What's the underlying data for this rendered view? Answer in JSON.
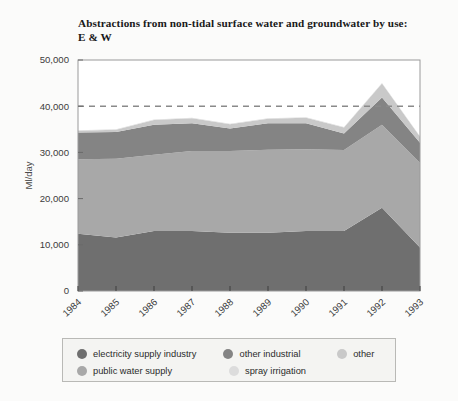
{
  "figure": {
    "background_color": "#fbfbfa",
    "title_line1": "Abstractions from non-tidal surface water and groundwater by use:",
    "title_line2": "E & W"
  },
  "axes": {
    "y_axis_label": "Ml/day",
    "y_ticks": [
      "0",
      "10,000",
      "20,000",
      "30,000",
      "40,000",
      "50,000"
    ],
    "x_ticks": [
      "1984",
      "1985",
      "1986",
      "1987",
      "1988",
      "1989",
      "1990",
      "1991",
      "1992",
      "1993"
    ],
    "reference_line_value": "40,000",
    "reference_line_style": "dashed"
  },
  "legend": {
    "row1": [
      {
        "label": "electricity supply industry",
        "color": "#6f6f6f"
      },
      {
        "label": "other industrial",
        "color": "#848484"
      },
      {
        "label": "other",
        "color": "#c9c9c9"
      }
    ],
    "row2": [
      {
        "label": "public water supply",
        "color": "#a8a8a8"
      },
      {
        "label": "spray irrigation",
        "color": "#dcdcdc"
      }
    ]
  },
  "chart_data": {
    "type": "area",
    "stacked": true,
    "title": "Abstractions from non-tidal surface water and groundwater by use: E & W",
    "xlabel": "",
    "ylabel": "Ml/day",
    "ylim": [
      0,
      50000
    ],
    "xlim": [
      "1984",
      "1993"
    ],
    "grid": false,
    "legend_position": "bottom",
    "categories": [
      "1984",
      "1985",
      "1986",
      "1987",
      "1988",
      "1989",
      "1990",
      "1991",
      "1992",
      "1993"
    ],
    "series": [
      {
        "name": "electricity supply industry",
        "color": "#6f6f6f",
        "values": [
          12400,
          11600,
          13000,
          13000,
          12600,
          12600,
          13000,
          13000,
          18000,
          9400
        ]
      },
      {
        "name": "public water supply",
        "color": "#a8a8a8",
        "values": [
          16100,
          17000,
          16500,
          17300,
          17700,
          18000,
          17700,
          17500,
          18000,
          18300
        ]
      },
      {
        "name": "other industrial",
        "color": "#848484",
        "values": [
          5800,
          5800,
          6500,
          6000,
          4900,
          5700,
          5600,
          3600,
          5900,
          4400
        ]
      },
      {
        "name": "other",
        "color": "#c9c9c9",
        "values": [
          400,
          500,
          1000,
          1100,
          900,
          1000,
          1200,
          1300,
          3000,
          1300
        ]
      },
      {
        "name": "spray irrigation",
        "color": "#dcdcdc",
        "values": [
          100,
          100,
          100,
          100,
          100,
          100,
          100,
          100,
          100,
          100
        ]
      }
    ],
    "annotations": [
      {
        "type": "hline",
        "value": 40000,
        "style": "dashed",
        "color": "#8a8a8a"
      }
    ]
  }
}
